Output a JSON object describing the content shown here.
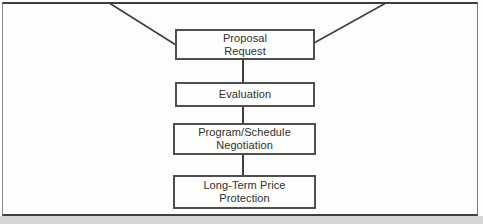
{
  "diagram": {
    "type": "flowchart",
    "nodes": [
      {
        "id": "proposal-request",
        "lines": [
          "Proposal",
          "Request"
        ]
      },
      {
        "id": "evaluation",
        "lines": [
          "Evaluation"
        ]
      },
      {
        "id": "program-schedule-negotiation",
        "lines": [
          "Program/Schedule",
          "Negotiation"
        ]
      },
      {
        "id": "long-term-price-protection",
        "lines": [
          "Long-Term Price",
          "Protection"
        ]
      }
    ],
    "edges": [
      {
        "from": "top-edge-left",
        "to": "proposal-request",
        "style": "diagonal"
      },
      {
        "from": "top-edge-right",
        "to": "proposal-request",
        "style": "diagonal"
      },
      {
        "from": "proposal-request",
        "to": "evaluation"
      },
      {
        "from": "evaluation",
        "to": "program-schedule-negotiation"
      },
      {
        "from": "program-schedule-negotiation",
        "to": "long-term-price-protection"
      }
    ],
    "colors": {
      "line": "#3f3f3f",
      "box_border": "#4f4f4f",
      "text": "#2e2e2e",
      "background": "#fdfdfc",
      "scan_band": "#d6d6d4"
    }
  }
}
